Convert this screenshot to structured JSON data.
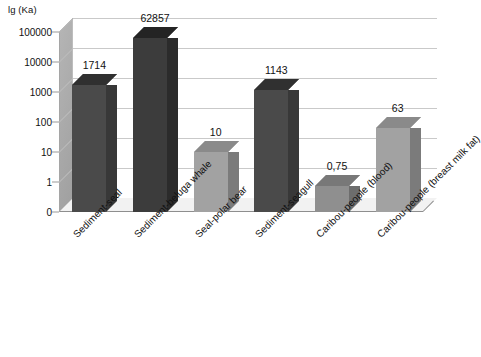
{
  "chart_data": {
    "type": "bar",
    "title": "",
    "subtitle": "",
    "xlabel": "",
    "ylabel": "lg (Ka)",
    "scale": "log",
    "grid": true,
    "legend": "none",
    "style": "3d-column",
    "ylim": [
      0,
      100000
    ],
    "ytick_labels": [
      "100000",
      "10000",
      "1000",
      "100",
      "10",
      "1",
      "0"
    ],
    "ytick_values": [
      100000,
      10000,
      1000,
      100,
      10,
      1,
      0
    ],
    "categories": [
      "Sediment-seal",
      "Sediment-beluga whale",
      "Seal-polar bear",
      "Sediment-seagull",
      "Caribou-people (blood)",
      "Caribou-people (breast milk fat)"
    ],
    "values": [
      1714,
      62857,
      10,
      1143,
      0.75,
      63
    ],
    "value_labels": [
      "1714",
      "62857",
      "10",
      "1143",
      "0,75",
      "63"
    ],
    "bar_colors": [
      "#4a4a4a",
      "#3c3c3c",
      "#a2a2a2",
      "#4a4a4a",
      "#8f8f8f",
      "#a2a2a2"
    ],
    "bar_side_colors": [
      "#383838",
      "#2b2b2b",
      "#7b7b7b",
      "#383838",
      "#6d6d6d",
      "#7b7b7b"
    ],
    "bar_top_colors": [
      "#303030",
      "#242424",
      "#8a8a8a",
      "#303030",
      "#787878",
      "#8a8a8a"
    ]
  },
  "figure": {
    "caption": ""
  }
}
